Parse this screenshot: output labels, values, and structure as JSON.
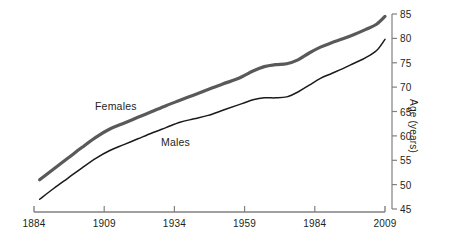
{
  "chart_data": {
    "type": "line",
    "title": "",
    "subtitle": "",
    "xlabel": "",
    "ylabel": "Age (years)",
    "xlim": [
      1884,
      2009
    ],
    "ylim": [
      45,
      85
    ],
    "grid": false,
    "legend_position": "inline-annotations",
    "x_ticks": [
      "1884",
      "1909",
      "1934",
      "1959",
      "1984",
      "2009"
    ],
    "x_tick_values": [
      1884,
      1909,
      1934,
      1959,
      1984,
      2009
    ],
    "y_ticks": [
      "45",
      "50",
      "55",
      "60",
      "65",
      "70",
      "75",
      "80",
      "85"
    ],
    "y_tick_values": [
      45,
      50,
      55,
      60,
      65,
      70,
      75,
      80,
      85
    ],
    "y_axis_side": "right",
    "x": [
      1886,
      1891,
      1896,
      1901,
      1906,
      1911,
      1916,
      1921,
      1926,
      1931,
      1936,
      1941,
      1946,
      1951,
      1956,
      1959,
      1962,
      1966,
      1970,
      1974,
      1978,
      1982,
      1986,
      1990,
      1994,
      1998,
      2002,
      2006,
      2009
    ],
    "series": [
      {
        "name": "Females",
        "color": "#595959",
        "line_width": 3.2,
        "values": [
          51.0,
          53.2,
          55.4,
          57.6,
          59.7,
          61.4,
          62.6,
          63.8,
          65.0,
          66.2,
          67.3,
          68.4,
          69.5,
          70.6,
          71.6,
          72.4,
          73.3,
          74.2,
          74.6,
          74.8,
          75.6,
          77.0,
          78.2,
          79.1,
          79.9,
          80.8,
          81.8,
          82.9,
          84.5
        ]
      },
      {
        "name": "Males",
        "color": "#1a1a1a",
        "line_width": 1.5,
        "values": [
          47.0,
          49.2,
          51.3,
          53.4,
          55.4,
          57.0,
          58.2,
          59.4,
          60.6,
          61.7,
          62.8,
          63.5,
          64.2,
          65.2,
          66.2,
          66.8,
          67.4,
          67.8,
          67.8,
          68.0,
          69.0,
          70.4,
          71.8,
          72.8,
          73.8,
          74.9,
          76.0,
          77.5,
          79.8
        ]
      }
    ],
    "annotations": [
      {
        "text": "Females",
        "x_px": 95,
        "y_px": 100
      },
      {
        "text": "Males",
        "x_px": 161,
        "y_px": 136
      }
    ],
    "colors": {
      "females_line": "#595959",
      "males_line": "#1a1a1a",
      "axis": "#808080",
      "text": "#231f20",
      "background": "#ffffff"
    }
  }
}
